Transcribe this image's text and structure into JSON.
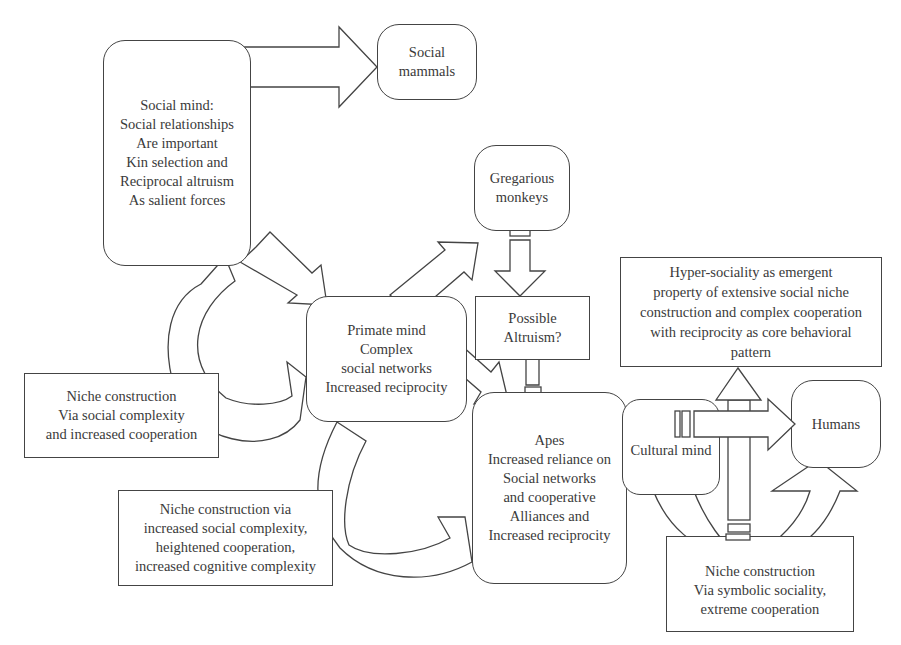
{
  "diagram": {
    "type": "flowchart",
    "nodes": {
      "social_mind": {
        "text": "Social mind:\nSocial relationships\nAre important\nKin selection and\nReciprocal altruism\nAs salient forces"
      },
      "social_mammals": {
        "text": "Social\nmammals"
      },
      "gregarious_monkeys": {
        "text": "Gregarious\nmonkeys"
      },
      "primate_mind": {
        "text": "Primate mind\nComplex\nsocial networks\nIncreased reciprocity"
      },
      "possible_altruism": {
        "text": "Possible\nAltruism?"
      },
      "niche_social_complexity": {
        "text": "Niche construction\nVia social complexity\nand increased cooperation"
      },
      "hyper_sociality": {
        "text": "Hyper-sociality as emergent\nproperty of extensive social niche\nconstruction and complex cooperation\nwith reciprocity as core behavioral\npattern"
      },
      "apes": {
        "text": "Apes\nIncreased reliance on\nSocial networks\nand cooperative\nAlliances and\nIncreased reciprocity"
      },
      "niche_cognitive": {
        "text": "Niche construction via\nincreased social complexity,\nheightened cooperation,\nincreased cognitive complexity"
      },
      "cultural_mind": {
        "text": "Cultural mind"
      },
      "humans": {
        "text": "Humans"
      },
      "niche_symbolic": {
        "text": "Niche construction\nVia symbolic sociality,\nextreme cooperation"
      }
    },
    "edges": [
      {
        "from": "social_mind",
        "to": "social_mammals",
        "style": "block-arrow"
      },
      {
        "from": "social_mind",
        "to": "primate_mind",
        "style": "block-arrow"
      },
      {
        "from": "primate_mind",
        "to": "gregarious_monkeys",
        "style": "block-arrow"
      },
      {
        "from": "gregarious_monkeys",
        "to": "possible_altruism",
        "style": "block-arrow"
      },
      {
        "from": "primate_mind",
        "to": "apes",
        "style": "block-arrow"
      },
      {
        "from": "apes",
        "to": "possible_altruism",
        "style": "block-arrow"
      },
      {
        "from": "social_mind",
        "to": "primate_mind",
        "style": "curved-arrow",
        "via": "niche_social_complexity"
      },
      {
        "from": "primate_mind",
        "to": "apes",
        "style": "curved-arrow",
        "via": "niche_cognitive"
      },
      {
        "from": "cultural_mind",
        "to": "humans",
        "style": "block-arrow"
      },
      {
        "from": "niche_symbolic",
        "to": "hyper_sociality",
        "style": "block-arrow"
      },
      {
        "from": "cultural_mind",
        "to": "humans",
        "style": "curved-arrow",
        "via": "niche_symbolic"
      }
    ]
  }
}
